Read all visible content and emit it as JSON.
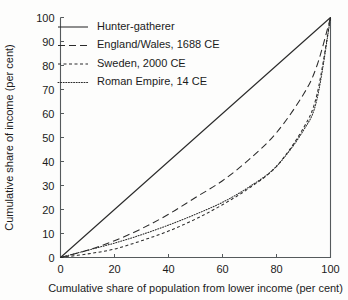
{
  "chart_data": {
    "type": "line",
    "title": "",
    "xlabel": "Cumulative share of population from lower income (per cent)",
    "ylabel": "Cumulative share of income (per cent)",
    "xlim": [
      0,
      100
    ],
    "ylim": [
      0,
      100
    ],
    "xticks": [
      "0",
      "20",
      "40",
      "60",
      "80",
      "100"
    ],
    "xtick_values": [
      0,
      20,
      40,
      60,
      80,
      100
    ],
    "yticks": [
      "0",
      "10",
      "20",
      "30",
      "40",
      "50",
      "60",
      "70",
      "80",
      "90",
      "100"
    ],
    "ytick_values": [
      0,
      10,
      20,
      30,
      40,
      50,
      60,
      70,
      80,
      90,
      100
    ],
    "grid": false,
    "legend_position": "upper-left-inside",
    "x": [
      0,
      10,
      20,
      30,
      40,
      50,
      60,
      70,
      80,
      90,
      95,
      100
    ],
    "series": [
      {
        "name": "Hunter-gatherer",
        "style": "solid",
        "dash": "none",
        "values": [
          0,
          10,
          20,
          30,
          40,
          50,
          60,
          70,
          80,
          90,
          95,
          100
        ]
      },
      {
        "name": "England/Wales, 1688 CE",
        "style": "long-dashed",
        "dash": "7,4",
        "values": [
          0,
          3,
          7,
          12,
          18,
          25,
          32,
          41,
          52,
          68,
          80,
          100
        ]
      },
      {
        "name": "Sweden, 2000 CE",
        "style": "short-dashed",
        "dash": "3,2.5",
        "values": [
          0,
          1.5,
          3.5,
          7,
          11,
          16,
          22,
          29,
          38,
          54,
          68,
          100
        ]
      },
      {
        "name": "Roman Empire, 14 CE",
        "style": "dotted",
        "dash": "1,1.6",
        "values": [
          0,
          3,
          6,
          9.5,
          13.5,
          18,
          23,
          29.5,
          38,
          53,
          66,
          100
        ]
      }
    ]
  },
  "legend": {
    "entries": [
      {
        "label": "Hunter-gatherer"
      },
      {
        "label": "England/Wales, 1688 CE"
      },
      {
        "label": "Sweden, 2000 CE"
      },
      {
        "label": "Roman Empire, 14 CE"
      }
    ]
  },
  "colors": {
    "background": "#fdfdfc",
    "axis": "#555a5c",
    "line": "#2a2a2a",
    "text": "#1b1b1b"
  }
}
